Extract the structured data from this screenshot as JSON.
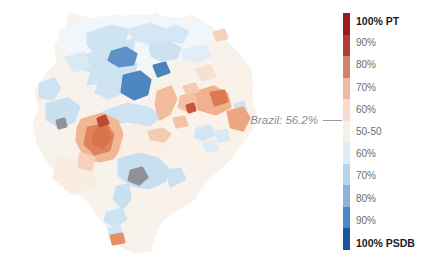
{
  "annotation": {
    "text": "Brazil: 56.2%"
  },
  "legend": {
    "items": [
      {
        "label": "100% PT",
        "color": "#9e191d",
        "bold": true
      },
      {
        "label": "90%",
        "color": "#b23c35",
        "bold": false
      },
      {
        "label": "80%",
        "color": "#d4826a",
        "bold": false
      },
      {
        "label": "70%",
        "color": "#ecbaa0",
        "bold": false
      },
      {
        "label": "60%",
        "color": "#f8ddcd",
        "bold": false
      },
      {
        "label": "50-50",
        "color": "#f6f0e9",
        "bold": false
      },
      {
        "label": "60%",
        "color": "#ddecf5",
        "bold": false
      },
      {
        "label": "70%",
        "color": "#b7d6ea",
        "bold": false
      },
      {
        "label": "80%",
        "color": "#8ab5d9",
        "bold": false
      },
      {
        "label": "90%",
        "color": "#4a88c2",
        "bold": false
      },
      {
        "label": "100% PSDB",
        "color": "#1a57a2",
        "bold": true
      }
    ]
  },
  "chart_data": {
    "type": "heatmap",
    "subtype": "choropleth",
    "title": "",
    "geography": "Brazil (municipality-level election result map)",
    "legend_labels": [
      "100% PT",
      "90%",
      "80%",
      "70%",
      "60%",
      "50-50",
      "60%",
      "70%",
      "80%",
      "90%",
      "100% PSDB"
    ],
    "legend_colors": [
      "#9e191d",
      "#b23c35",
      "#d4826a",
      "#ecbaa0",
      "#f8ddcd",
      "#f6f0e9",
      "#ddecf5",
      "#b7d6ea",
      "#8ab5d9",
      "#4a88c2",
      "#1a57a2"
    ],
    "legend_position": "right",
    "scale_top_party": "PT",
    "scale_bottom_party": "PSDB",
    "annotations": [
      {
        "label": "Brazil",
        "value_pct": 56.2,
        "side": "PT"
      }
    ]
  },
  "map": {
    "shapes": [
      {
        "name": "map-base-landmass",
        "fill": "#f8f2ec",
        "points": "70,14 92,20 118,16 138,24 156,14 172,22 192,16 205,24 216,32 228,44 240,56 250,70 252,86 248,98 255,112 252,128 242,142 232,156 220,168 208,178 198,192 186,202 172,212 160,222 154,236 150,250 136,252 122,246 112,236 106,224 96,212 86,198 72,188 58,174 46,158 38,142 34,124 40,108 36,92 46,76 58,62 56,46 66,30"
      },
      {
        "name": "map-wash-north-blue",
        "fill": "#f1f6fa",
        "points": "60,30 100,18 150,16 200,22 215,35 190,55 150,70 110,80 80,72 62,50"
      },
      {
        "name": "map-wash-east-warm",
        "fill": "#faf1e9",
        "points": "160,80 220,60 250,70 252,120 230,150 190,170 165,150 155,110"
      },
      {
        "name": "map-wash-center-pink",
        "fill": "#faefe7",
        "points": "100,128 150,126 168,140 160,158 140,160 118,158 100,150"
      },
      {
        "name": "map-region-blue-north-big",
        "fill": "#cfe4f2",
        "points": "88,34 112,26 128,30 124,42 134,40 132,52 120,56 124,66 136,64 134,76 120,82 122,92 108,98 96,92 100,82 88,84 92,72 82,68 86,56 94,52 88,44"
      },
      {
        "name": "map-region-blue-north-arm",
        "fill": "#d5e7f4",
        "points": "128,30 150,24 166,30 176,26 188,32 182,42 168,40 158,46 146,42 136,40"
      },
      {
        "name": "map-region-blue-north-east",
        "fill": "#cde2f1",
        "points": "150,46 168,42 180,48 176,58 162,60 152,56"
      },
      {
        "name": "map-region-darkblue-1",
        "fill": "#5e92c6",
        "points": "112,52 126,48 136,54 133,64 119,66 109,60"
      },
      {
        "name": "map-region-darkblue-2",
        "fill": "#4d86c0",
        "points": "124,76 140,72 150,80 147,94 134,99 122,92"
      },
      {
        "name": "map-region-darkblue-small",
        "fill": "#4b83bd",
        "points": "154,66 165,63 169,72 158,76"
      },
      {
        "name": "map-region-blue-west-1",
        "fill": "#cde3f1",
        "points": "40,84 54,79 60,88 53,99 40,97"
      },
      {
        "name": "map-region-blue-west-2",
        "fill": "#c8e0f0",
        "points": "47,104 68,99 79,107 74,121 59,127 47,119"
      },
      {
        "name": "map-region-gray-west-dot",
        "fill": "#8e9296",
        "points": "57,121 64,119 66,126 59,128"
      },
      {
        "name": "map-region-blue-mid-band",
        "fill": "#cde3f1",
        "points": "104,112 128,104 148,108 160,116 150,125 129,121 111,124"
      },
      {
        "name": "map-region-blue-ne-pale",
        "fill": "#e2eef7",
        "points": "184,50 205,46 210,56 196,62 184,58"
      },
      {
        "name": "map-region-salmon-ne-pale",
        "fill": "#f8e0d0",
        "points": "196,70 210,66 215,76 202,80"
      },
      {
        "name": "map-region-blue-nw-arm",
        "fill": "#d9eaf5",
        "points": "66,58 84,53 89,66 74,71"
      },
      {
        "name": "map-region-pink-left-bottom",
        "fill": "#f9ece1",
        "points": "58,158 90,163 96,184 74,194 54,178"
      },
      {
        "name": "map-region-pink-right-bottom",
        "fill": "#f9f0e9",
        "points": "148,194 180,189 196,197 174,211 153,207"
      },
      {
        "name": "map-region-orange-cluster-outer",
        "fill": "#f1b794",
        "points": "82,120 102,114 117,121 122,134 117,152 113,158 99,161 85,156 77,141 78,128"
      },
      {
        "name": "map-region-orange-tail",
        "fill": "#f6d2bc",
        "points": "80,154 94,158 91,170 79,167"
      },
      {
        "name": "map-region-orange-core",
        "fill": "#e0835a",
        "points": "88,128 106,124 113,135 109,150 95,154 85,144"
      },
      {
        "name": "map-region-orange-core-dark",
        "fill": "#d8744a",
        "points": "95,131 106,128 110,138 103,147 93,143"
      },
      {
        "name": "map-region-red-dot-cluster",
        "fill": "#bf4936",
        "points": "98,119 105,116 108,123 100,126"
      },
      {
        "name": "map-region-salmon-strip",
        "fill": "#f2bb9b",
        "points": "158,92 171,87 176,99 169,114 160,119 156,104"
      },
      {
        "name": "map-region-salmon-mid",
        "fill": "#f3c1a4",
        "points": "181,97 195,93 200,104 190,112 179,107"
      },
      {
        "name": "map-region-salmon-big-east",
        "fill": "#f0b18c",
        "points": "197,92 214,87 227,94 230,107 216,114 199,109"
      },
      {
        "name": "map-region-orange-east-core",
        "fill": "#db7950",
        "points": "211,93 224,91 227,101 215,105"
      },
      {
        "name": "map-region-salmon-ne-small",
        "fill": "#f5cab1",
        "points": "184,87 195,84 198,91 187,93"
      },
      {
        "name": "map-region-red-dot-east",
        "fill": "#cb5340",
        "points": "187,106 193,104 195,110 189,112"
      },
      {
        "name": "map-region-salmon-top-dot",
        "fill": "#f6d0ba",
        "points": "214,33 224,30 227,38 217,40"
      },
      {
        "name": "map-region-blue-east-edge",
        "fill": "#cfe4f2",
        "points": "235,105 243,102 246,111 237,113"
      },
      {
        "name": "map-region-salmon-east-edge",
        "fill": "#eca57e",
        "points": "228,112 243,108 249,118 243,130 231,127"
      },
      {
        "name": "map-region-blue-east-1",
        "fill": "#d3e6f3",
        "points": "197,129 210,126 214,135 203,140 195,137"
      },
      {
        "name": "map-region-blue-east-2",
        "fill": "#d8e9f4",
        "points": "216,132 226,130 229,139 219,142"
      },
      {
        "name": "map-region-blue-east-low",
        "fill": "#dcebf5",
        "points": "204,144 214,141 217,149 207,152"
      },
      {
        "name": "map-region-orange-mid-scatter",
        "fill": "#f4ccb2",
        "points": "149,132 162,129 170,134 164,141 151,139"
      },
      {
        "name": "map-region-orange-mid-2",
        "fill": "#f3c3a7",
        "points": "174,119 184,117 187,125 177,127"
      },
      {
        "name": "map-region-blue-south-big",
        "fill": "#c6def0",
        "points": "119,160 139,154 158,159 168,169 165,181 149,188 132,185 119,175"
      },
      {
        "name": "map-region-gray-south-blob",
        "fill": "#8f9196",
        "points": "131,171 142,168 147,177 139,184 129,180"
      },
      {
        "name": "map-region-blue-south-east",
        "fill": "#cbe1f1",
        "points": "167,171 180,169 185,179 171,186"
      },
      {
        "name": "map-region-blue-south-stem",
        "fill": "#c9e0f0",
        "points": "117,187 128,185 130,199 123,208 114,199"
      },
      {
        "name": "map-region-blue-south-2",
        "fill": "#cde3f1",
        "points": "107,213 121,209 126,219 115,226 105,221"
      },
      {
        "name": "map-region-blue-south-3",
        "fill": "#d3e6f3",
        "points": "109,229 120,227 122,235 111,237"
      },
      {
        "name": "map-region-orange-south-tip",
        "fill": "#e88f68",
        "points": "111,236 122,234 124,242 113,244"
      }
    ]
  }
}
